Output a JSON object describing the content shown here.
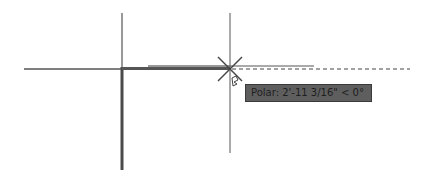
{
  "canvas": {
    "background": "#ffffff",
    "line_color": "#3c3c3c"
  },
  "tooltip": {
    "text": "Polar: 2'-11 3/16\" < 0°",
    "background": "#5e5e5e"
  },
  "cursor": {
    "type": "crosshair-with-snap-marker"
  }
}
